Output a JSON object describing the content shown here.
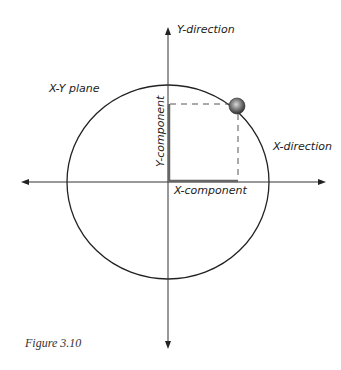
{
  "diagram": {
    "labels": {
      "y_direction": "Y-direction",
      "x_direction": "X-direction",
      "plane": "X-Y plane",
      "y_component": "Y-component",
      "x_component": "X-component"
    },
    "caption": "Figure 3.10",
    "colors": {
      "axis": "#333333",
      "ellipse": "#222222",
      "component": "#666666",
      "dashed": "#555555",
      "ball_light": "#bbbbbb",
      "ball_dark": "#333333"
    },
    "geometry": {
      "origin": [
        168,
        182
      ],
      "ellipse_rx": 101,
      "ellipse_ry": 97,
      "ball_center": [
        237,
        106
      ],
      "ball_radius": 8
    }
  }
}
